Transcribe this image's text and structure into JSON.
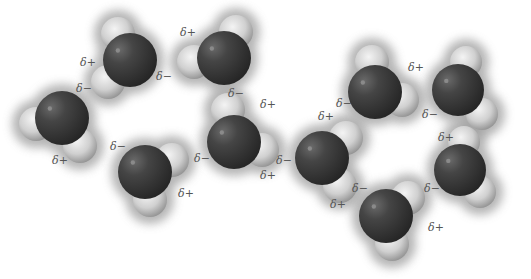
{
  "figure": {
    "colors": {
      "background": "#ffffff",
      "oxygen_dark": "#2e2e2e",
      "oxygen_mid": "#4a4a4a",
      "hydrogen_light": "#e6e6e6",
      "hydrogen_shade": "#9a9a9a",
      "halo": "#9c9c9c",
      "label": "#555555"
    },
    "charge_labels": {
      "partial_positive": "δ+",
      "partial_negative": "δ−"
    }
  },
  "molecules": [
    {
      "id": 1,
      "ox": 62,
      "oy": 118,
      "r": 27,
      "h": [
        [
          36,
          124
        ],
        [
          80,
          146
        ]
      ]
    },
    {
      "id": 2,
      "ox": 130,
      "oy": 60,
      "r": 27,
      "h": [
        [
          118,
          34
        ],
        [
          108,
          82
        ]
      ]
    },
    {
      "id": 3,
      "ox": 224,
      "oy": 58,
      "r": 27,
      "h": [
        [
          236,
          32
        ],
        [
          194,
          62
        ]
      ]
    },
    {
      "id": 4,
      "ox": 234,
      "oy": 142,
      "r": 27,
      "h": [
        [
          228,
          110
        ],
        [
          262,
          150
        ]
      ]
    },
    {
      "id": 5,
      "ox": 145,
      "oy": 172,
      "r": 27,
      "h": [
        [
          172,
          160
        ],
        [
          150,
          200
        ]
      ]
    },
    {
      "id": 6,
      "ox": 322,
      "oy": 158,
      "r": 27,
      "h": [
        [
          346,
          138
        ],
        [
          340,
          186
        ]
      ]
    },
    {
      "id": 7,
      "ox": 375,
      "oy": 92,
      "r": 27,
      "h": [
        [
          372,
          62
        ],
        [
          402,
          100
        ]
      ]
    },
    {
      "id": 8,
      "ox": 458,
      "oy": 90,
      "r": 26,
      "h": [
        [
          466,
          62
        ],
        [
          482,
          114
        ]
      ]
    },
    {
      "id": 9,
      "ox": 460,
      "oy": 170,
      "r": 26,
      "h": [
        [
          464,
          142
        ],
        [
          480,
          192
        ]
      ]
    },
    {
      "id": 10,
      "ox": 386,
      "oy": 216,
      "r": 27,
      "h": [
        [
          408,
          198
        ],
        [
          392,
          244
        ]
      ]
    }
  ],
  "labels": [
    {
      "text": "δ−",
      "x": 84,
      "y": 88
    },
    {
      "text": "δ+",
      "x": 60,
      "y": 160
    },
    {
      "text": "δ+",
      "x": 88,
      "y": 62
    },
    {
      "text": "δ−",
      "x": 164,
      "y": 76
    },
    {
      "text": "δ+",
      "x": 188,
      "y": 32
    },
    {
      "text": "δ−",
      "x": 236,
      "y": 93
    },
    {
      "text": "δ+",
      "x": 268,
      "y": 104
    },
    {
      "text": "δ−",
      "x": 202,
      "y": 158
    },
    {
      "text": "δ+",
      "x": 268,
      "y": 175
    },
    {
      "text": "δ−",
      "x": 118,
      "y": 146
    },
    {
      "text": "δ+",
      "x": 186,
      "y": 193
    },
    {
      "text": "δ+",
      "x": 326,
      "y": 116
    },
    {
      "text": "δ−",
      "x": 284,
      "y": 160
    },
    {
      "text": "δ+",
      "x": 338,
      "y": 204
    },
    {
      "text": "δ+",
      "x": 416,
      "y": 67
    },
    {
      "text": "δ−",
      "x": 344,
      "y": 103
    },
    {
      "text": "δ−",
      "x": 430,
      "y": 114
    },
    {
      "text": "δ+",
      "x": 446,
      "y": 137
    },
    {
      "text": "δ−",
      "x": 432,
      "y": 188
    },
    {
      "text": "δ−",
      "x": 360,
      "y": 188
    },
    {
      "text": "δ+",
      "x": 436,
      "y": 227
    }
  ]
}
